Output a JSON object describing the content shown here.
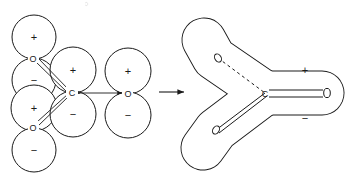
{
  "figure": {
    "title": "",
    "type": "molecular-surface-union-diagram",
    "transform_arrow": "→",
    "left_panel": {
      "name": "overlapping-spheres-model",
      "atoms": [
        {
          "id": "o-top-left",
          "label": "O",
          "cx": 33,
          "cy": 58
        },
        {
          "id": "o-bottom-left",
          "label": "O",
          "cx": 33,
          "cy": 127
        },
        {
          "id": "c-center",
          "label": "C",
          "cx": 72,
          "cy": 92
        },
        {
          "id": "o-right",
          "label": "O",
          "cx": 128,
          "cy": 93
        }
      ],
      "spheres": [
        {
          "id": "sphere-1",
          "sign": "+",
          "cx": 34,
          "cy": 37,
          "r": 22
        },
        {
          "id": "sphere-2",
          "sign": "−",
          "cx": 34,
          "cy": 80,
          "r": 22
        },
        {
          "id": "sphere-3",
          "sign": "+",
          "cx": 34,
          "cy": 108,
          "r": 23
        },
        {
          "id": "sphere-4",
          "sign": "−",
          "cx": 34,
          "cy": 150,
          "r": 22
        },
        {
          "id": "sphere-5",
          "sign": "+",
          "cx": 73,
          "cy": 70,
          "r": 23
        },
        {
          "id": "sphere-6",
          "sign": "−",
          "cx": 73,
          "cy": 114,
          "r": 23
        },
        {
          "id": "sphere-7",
          "sign": "+",
          "cx": 128,
          "cy": 71,
          "r": 23
        },
        {
          "id": "sphere-8",
          "sign": "−",
          "cx": 128,
          "cy": 115,
          "r": 23
        }
      ],
      "bonds": [
        {
          "id": "bond-o-top-c",
          "from": "o-top-left",
          "to": "c-center"
        },
        {
          "id": "bond-o-bottom-c",
          "from": "o-bottom-left",
          "to": "c-center"
        },
        {
          "id": "bond-c-o-right",
          "from": "c-center",
          "to": "o-right"
        }
      ]
    },
    "right_panel": {
      "name": "merged-surface-model",
      "signs": [
        {
          "id": "plus-sign",
          "label": "+",
          "x": 305,
          "y": 70
        },
        {
          "id": "minus-sign",
          "label": "−",
          "x": 305,
          "y": 118
        }
      ],
      "atom_markers": [
        {
          "id": "marker-o-upper",
          "label": "O",
          "cx": 218,
          "cy": 58
        },
        {
          "id": "marker-o-lower",
          "label": "O",
          "cx": 216,
          "cy": 130
        },
        {
          "id": "marker-c",
          "label": "C",
          "cx": 265,
          "cy": 94
        },
        {
          "id": "marker-o-right",
          "label": "O",
          "cx": 327,
          "cy": 93
        }
      ],
      "dashed_segment": {
        "id": "hidden-bond",
        "from": "marker-o-upper",
        "to": "marker-c"
      }
    },
    "colors": {
      "stroke": "#1a1a1a",
      "background": "#ffffff",
      "fill": "#ffffff"
    }
  }
}
